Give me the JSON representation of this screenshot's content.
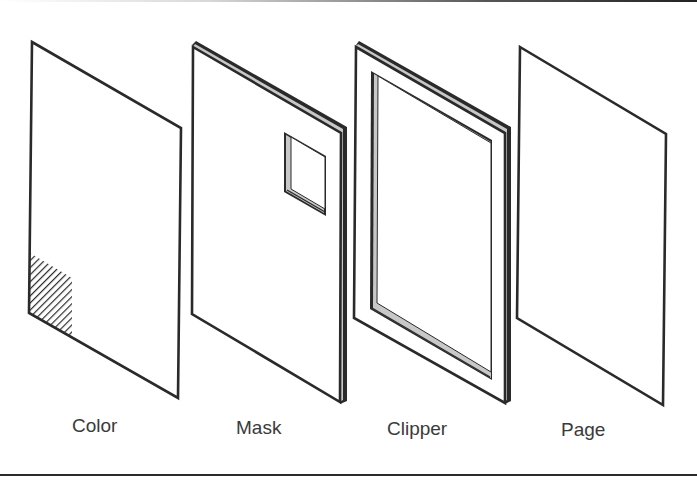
{
  "figure": {
    "panels": [
      {
        "id": "color",
        "label": "Color"
      },
      {
        "id": "mask",
        "label": "Mask"
      },
      {
        "id": "clipper",
        "label": "Clipper"
      },
      {
        "id": "page",
        "label": "Page"
      }
    ]
  },
  "colors": {
    "stroke": "#2a2a2a",
    "edge_highlight": "#c8c8c8",
    "label_text": "#3a3a3a",
    "background": "#ffffff"
  }
}
